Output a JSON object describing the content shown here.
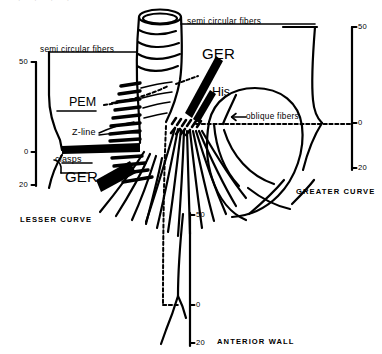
{
  "figure": {
    "type": "anatomical-diagram",
    "background_color": "#ffffff",
    "ink_color": "#000000"
  },
  "labels": {
    "semi_circular_fibers_top": "semi  circular  fibers",
    "semi_circular_fibers_left": "semi circular  fibers",
    "ger_top": "GER",
    "ger_bottom": "GER",
    "his": "His",
    "pem": "PEM",
    "z_line": "Z-line",
    "clasps": "clasps",
    "oblique_fibers": "oblique    fibers",
    "lesser_curve": "LESSER  CURVE",
    "greater_curve": "GREATER  CURVE",
    "anterior_wall": "ANTERIOR   WALL"
  },
  "scales": {
    "left": {
      "name": "lesser-curve-scale",
      "ticks": [
        {
          "value": "50",
          "y": 62
        },
        {
          "value": "0",
          "y": 152
        },
        {
          "value": "20",
          "y": 185
        }
      ]
    },
    "right": {
      "name": "greater-curve-scale",
      "ticks": [
        {
          "value": "50",
          "y": 27
        },
        {
          "value": "0",
          "y": 123
        },
        {
          "value": "20",
          "y": 168
        }
      ]
    },
    "bottom": {
      "name": "anterior-wall-scale",
      "ticks": [
        {
          "value": "50",
          "y": 215
        },
        {
          "value": "0",
          "y": 305
        },
        {
          "value": "20",
          "y": 343
        }
      ]
    }
  }
}
